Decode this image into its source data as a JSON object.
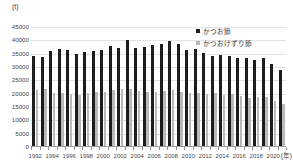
{
  "chart_data": {
    "type": "bar",
    "title": "",
    "subtitle": "",
    "xlabel": "(年)",
    "ylabel": "(t)",
    "ylim": [
      0,
      45000
    ],
    "ytick_step": 5000,
    "yticks": [
      "45000",
      "40000",
      "35000",
      "30000",
      "25000",
      "20000",
      "15000",
      "10000",
      "5000",
      "0"
    ],
    "grid": true,
    "legend_position": "top-right",
    "categories": [
      "1992",
      "1993",
      "1994",
      "1995",
      "1996",
      "1997",
      "1998",
      "1999",
      "2000",
      "2001",
      "2002",
      "2003",
      "2004",
      "2005",
      "2006",
      "2007",
      "2008",
      "2009",
      "2010",
      "2011",
      "2012",
      "2013",
      "2014",
      "2015",
      "2016",
      "2017",
      "2018",
      "2019",
      "2020",
      "2021"
    ],
    "xtick_labels": [
      "1992",
      "1994",
      "1996",
      "1998",
      "2000",
      "2002",
      "2004",
      "2006",
      "2008",
      "2010",
      "2012",
      "2014",
      "2016",
      "2018",
      "2020"
    ],
    "series": [
      {
        "name": "かつお節",
        "color": "#1d1d1d",
        "values": [
          34000,
          33700,
          35800,
          36800,
          36200,
          34900,
          35500,
          35800,
          36200,
          37800,
          37200,
          40100,
          37000,
          37400,
          38200,
          38600,
          39900,
          38700,
          36300,
          36500,
          35200,
          34000,
          34600,
          34100,
          33400,
          33200,
          32600,
          33200,
          31000,
          28900
        ]
      },
      {
        "name": "かつおけずり節",
        "color": "#b9b9b9",
        "values": [
          21200,
          21500,
          20100,
          20000,
          19600,
          19300,
          20200,
          20300,
          20500,
          21300,
          21400,
          21600,
          20900,
          20600,
          20500,
          20800,
          21000,
          20600,
          20000,
          19900,
          19700,
          20100,
          19200,
          19500,
          19100,
          18300,
          18600,
          18700,
          17200,
          15700
        ]
      }
    ]
  }
}
